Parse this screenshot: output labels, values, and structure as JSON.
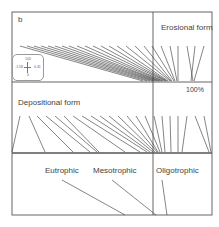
{
  "figure": {
    "panel_letter": "b",
    "labels": {
      "erosional": "Erosional form",
      "percent": "100%",
      "depositional": "Depositional form",
      "eutrophic": "Eutrophic",
      "mesotrophic": "Mesotrophic",
      "oligotrophic": "Oligotrophic"
    },
    "inset": {
      "top": "100",
      "left": "-1.58",
      "right": "0.41",
      "bottom": "0"
    },
    "colors": {
      "line": "#333333",
      "frame": "#555555"
    },
    "frame": {
      "x": 12,
      "y": 12,
      "w": 200,
      "h": 203,
      "vdiv": 153,
      "h1": 82,
      "h2": 153
    },
    "upper_lines": [
      [
        20,
        46,
        143,
        81
      ],
      [
        27,
        46,
        147,
        81
      ],
      [
        34,
        46,
        150,
        81
      ],
      [
        41,
        46,
        153,
        81
      ],
      [
        48,
        46,
        155,
        81
      ],
      [
        55,
        46,
        157,
        81
      ],
      [
        62,
        46,
        159,
        81
      ],
      [
        69,
        46,
        160,
        81
      ],
      [
        77,
        46,
        162,
        81
      ],
      [
        85,
        46,
        163,
        81
      ],
      [
        93,
        46,
        165,
        81
      ],
      [
        101,
        46,
        166,
        81
      ],
      [
        109,
        46,
        167,
        81
      ],
      [
        117,
        46,
        168,
        81
      ],
      [
        126,
        46,
        170,
        81
      ],
      [
        135,
        46,
        171,
        81
      ],
      [
        144,
        46,
        172,
        81
      ],
      [
        152,
        46,
        174,
        81
      ],
      [
        161,
        46,
        175,
        81
      ],
      [
        170,
        46,
        177,
        81
      ],
      [
        178,
        46,
        178,
        81
      ],
      [
        187,
        46,
        193,
        81
      ],
      [
        195,
        46,
        191,
        81
      ],
      [
        204,
        46,
        194,
        81
      ]
    ],
    "middle_lines": [
      [
        20,
        116,
        12,
        152
      ],
      [
        29,
        116,
        45,
        152
      ],
      [
        37,
        116,
        73,
        152
      ],
      [
        46,
        116,
        90,
        152
      ],
      [
        55,
        116,
        97,
        152
      ],
      [
        64,
        116,
        99,
        152
      ],
      [
        73,
        116,
        125,
        152
      ],
      [
        82,
        116,
        140,
        152
      ],
      [
        91,
        116,
        147,
        152
      ],
      [
        100,
        116,
        150,
        152
      ],
      [
        109,
        116,
        153,
        152
      ],
      [
        118,
        116,
        155,
        152
      ],
      [
        127,
        116,
        157,
        152
      ],
      [
        136,
        116,
        158,
        152
      ],
      [
        145,
        116,
        160,
        152
      ],
      [
        154,
        116,
        162,
        152
      ],
      [
        162,
        116,
        165,
        152
      ],
      [
        170,
        116,
        171,
        152
      ],
      [
        178,
        116,
        178,
        152
      ],
      [
        187,
        116,
        182,
        152
      ],
      [
        195,
        116,
        209,
        152
      ],
      [
        204,
        116,
        211,
        152
      ]
    ],
    "lower_lines": [
      [
        62,
        180,
        125,
        215
      ],
      [
        112,
        180,
        156,
        215
      ],
      [
        162,
        180,
        167,
        215
      ]
    ]
  }
}
